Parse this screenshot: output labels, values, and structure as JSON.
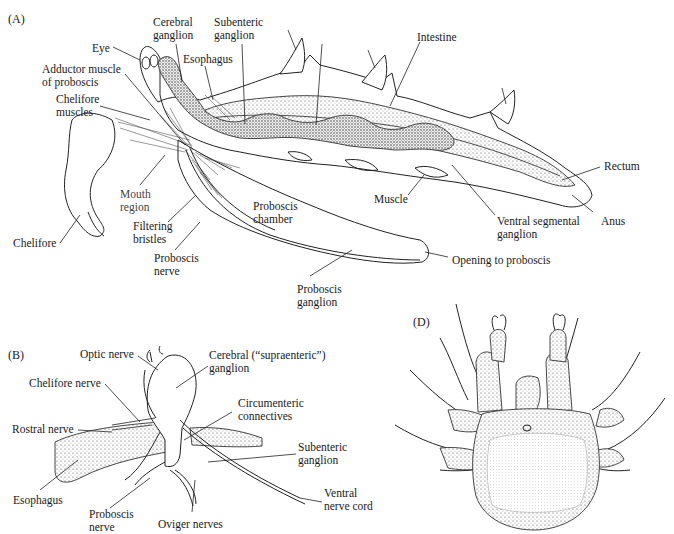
{
  "figure": {
    "panels": {
      "A": "(A)",
      "B": "(B)",
      "D": "(D)"
    },
    "panel_a_labels": {
      "cerebral_ganglion": [
        "Cerebral",
        "ganglion"
      ],
      "subenteric_ganglion": [
        "Subenteric",
        "ganglion"
      ],
      "eye": "Eye",
      "esophagus": "Esophagus",
      "adductor_muscle": [
        "Adductor muscle",
        "of proboscis"
      ],
      "chelifore_muscles": [
        "Chelifore",
        "muscles"
      ],
      "intestine": "Intestine",
      "rectum": "Rectum",
      "anus": "Anus",
      "muscle": "Muscle",
      "ventral_segmental_ganglion": [
        "Ventral segmental",
        "ganglion"
      ],
      "opening_to_proboscis": "Opening to proboscis",
      "mouth_region": [
        "Mouth",
        "region"
      ],
      "filtering_bristles": [
        "Filtering",
        "bristles"
      ],
      "proboscis_chamber": [
        "Proboscis",
        "chamber"
      ],
      "proboscis_nerve": [
        "Proboscis",
        "nerve"
      ],
      "proboscis_ganglion": [
        "Proboscis",
        "ganglion"
      ],
      "chelifore": "Chelifore"
    },
    "panel_b_labels": {
      "optic_nerve": "Optic nerve",
      "cerebral_ganglion": [
        "Cerebral (“supraenteric”)",
        "ganglion"
      ],
      "chelifore_nerve": "Chelifore nerve",
      "circumenteric_connectives": [
        "Circumenteric",
        "connectives"
      ],
      "rostral_nerve": "Rostral nerve",
      "subenteric_ganglion": [
        "Subenteric",
        "ganglion"
      ],
      "esophagus": "Esophagus",
      "proboscis_nerve": [
        "Proboscis",
        "nerve"
      ],
      "oviger_nerves": "Oviger nerves",
      "ventral_nerve_cord": [
        "Ventral",
        "nerve cord"
      ]
    }
  }
}
